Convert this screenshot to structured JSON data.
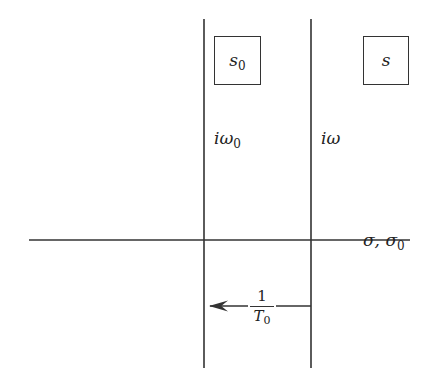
{
  "diagram": {
    "type": "complex-plane-strip",
    "axes": {
      "horizontal_label": "σ, σ₀",
      "horizontal_label_main": "σ, σ",
      "horizontal_label_sub": "0"
    },
    "lines": {
      "left_vertical_label_main": "iω",
      "left_vertical_label_sub": "0",
      "right_vertical_label": "iω"
    },
    "boxes": {
      "left_label_main": "s",
      "left_label_sub": "0",
      "right_label": "s"
    },
    "width_marker": {
      "numerator": "1",
      "denominator_main": "T",
      "denominator_sub": "0",
      "arrow_direction": "left"
    },
    "colors": {
      "ink": "#333333",
      "background": "#ffffff"
    }
  }
}
